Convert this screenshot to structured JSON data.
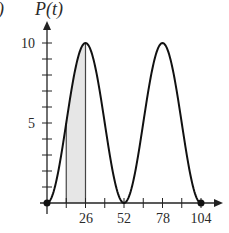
{
  "chart_data": {
    "type": "line",
    "title": "",
    "panel_label_fragment": ")",
    "ylabel": "P(t)",
    "xlabel": "",
    "xlim": [
      0,
      104
    ],
    "ylim": [
      0,
      10
    ],
    "x_tick_labels": [
      "26",
      "52",
      "78",
      "104"
    ],
    "x_tick_values": [
      13,
      26,
      39,
      52,
      65,
      78,
      91,
      104
    ],
    "y_tick_labels": [
      "5",
      "10"
    ],
    "y_tick_values": [
      1,
      2,
      3,
      4,
      5,
      6,
      7,
      8,
      9,
      10
    ],
    "series": [
      {
        "name": "P(t)",
        "function": "5 - 5*cos(2*pi*t/52)",
        "x": [
          0,
          13,
          26,
          39,
          52,
          65,
          78,
          91,
          104
        ],
        "values": [
          0,
          5,
          10,
          5,
          0,
          5,
          10,
          5,
          0
        ]
      }
    ],
    "shaded_region": {
      "x_start": 13,
      "x_end": 26,
      "under": "P(t)"
    },
    "endpoints": [
      {
        "x": 0,
        "y": 0
      },
      {
        "x": 104,
        "y": 0
      }
    ],
    "grid": false,
    "legend": null
  },
  "colors": {
    "curve": "#111111",
    "axis": "#222222",
    "shade": "#e6e6e6",
    "text": "#2a2a2a"
  }
}
